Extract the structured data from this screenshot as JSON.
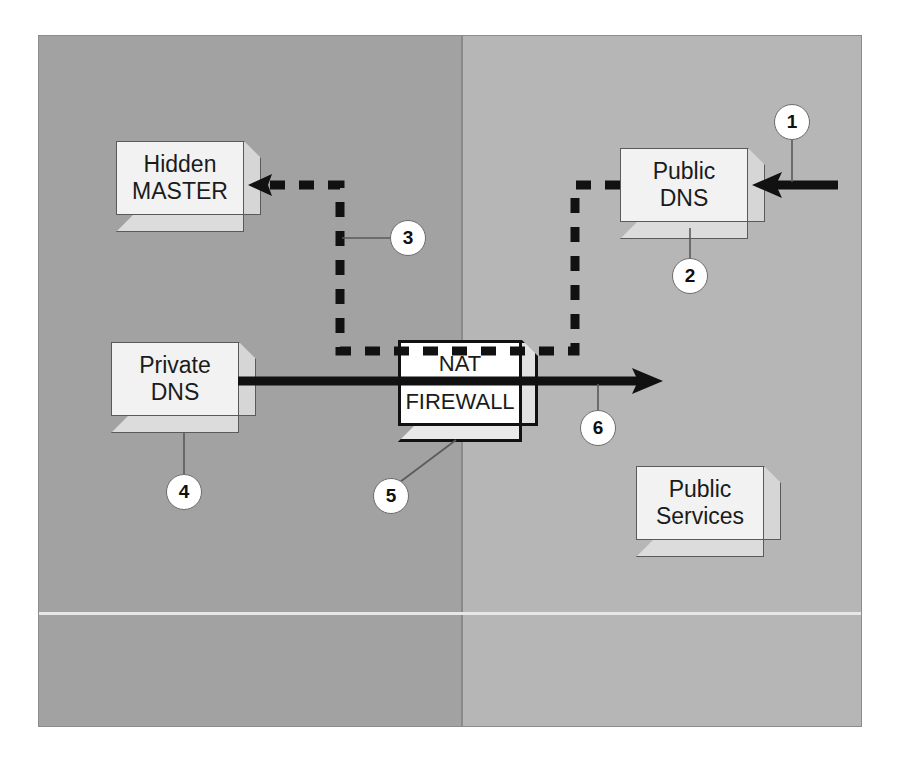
{
  "diagram": {
    "zones": [
      {
        "id": "private",
        "name": "Private network zone",
        "color": "#a2a2a2"
      },
      {
        "id": "public",
        "name": "Public network zone",
        "color": "#b6b6b6"
      }
    ],
    "nodes": [
      {
        "id": "hidden-master",
        "line1": "Hidden",
        "line2": "MASTER",
        "callout": "3"
      },
      {
        "id": "public-dns",
        "line1": "Public",
        "line2": "DNS",
        "callout": "2"
      },
      {
        "id": "private-dns",
        "line1": "Private",
        "line2": "DNS",
        "callout": "4"
      },
      {
        "id": "nat-firewall",
        "line1": "NAT",
        "line2": "FIREWALL",
        "callout": "5"
      },
      {
        "id": "public-services",
        "line1": "Public",
        "line2": "Services",
        "callout": ""
      }
    ],
    "callouts": [
      {
        "number": "1",
        "target": "inbound-query-arrow"
      },
      {
        "number": "2",
        "target": "public-dns"
      },
      {
        "number": "3",
        "target": "zone-transfer-path"
      },
      {
        "number": "4",
        "target": "private-dns"
      },
      {
        "number": "5",
        "target": "nat-firewall"
      },
      {
        "number": "6",
        "target": "outbound-query-arrow"
      }
    ],
    "connectors": [
      {
        "id": "inbound-query-arrow",
        "style": "solid",
        "direction": "left",
        "color": "#111111"
      },
      {
        "id": "zone-transfer-path",
        "style": "dashed",
        "direction": "left",
        "color": "#111111"
      },
      {
        "id": "outbound-query-arrow",
        "style": "solid",
        "direction": "right",
        "color": "#111111"
      }
    ]
  }
}
